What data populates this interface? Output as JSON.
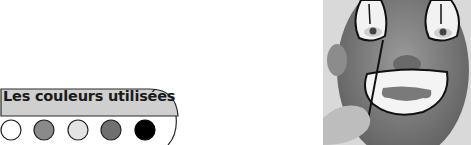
{
  "badge": {
    "title": "Les couleurs utilisées",
    "header_fill": "#cfcfcf",
    "swatches": [
      {
        "name": "white",
        "color": "#ffffff"
      },
      {
        "name": "medium-gray",
        "color": "#8a8a8a"
      },
      {
        "name": "light-gray",
        "color": "#e3e3e3"
      },
      {
        "name": "dark-gray",
        "color": "#6f6f6f"
      },
      {
        "name": "black",
        "color": "#000000"
      }
    ]
  },
  "photo": {
    "description": "Child face painted as a clown, a hand applying black line with a brush"
  }
}
